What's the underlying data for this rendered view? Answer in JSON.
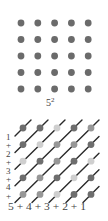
{
  "top": {
    "label_base": "5",
    "label_exp": "2",
    "grid": {
      "rows": 5,
      "cols": 5,
      "x0": 21,
      "y0": 23,
      "dx": 16.8,
      "dy": 16.5,
      "r": 3.4,
      "color": "#6b6b6b"
    }
  },
  "bottom": {
    "grid": {
      "rows": 5,
      "cols": 5,
      "x0": 23,
      "y0": 128,
      "dx": 17,
      "dy": 16.6,
      "r": 3.4
    },
    "shades": [
      [
        "dark",
        "dark",
        "light",
        "dark",
        "medium"
      ],
      [
        "dark",
        "light",
        "medium",
        "medium",
        "dark"
      ],
      [
        "light",
        "dark",
        "medium",
        "dark",
        "light"
      ],
      [
        "dark",
        "medium",
        "dark",
        "light",
        "dark"
      ],
      [
        "medium",
        "medium",
        "light",
        "dark",
        "dark"
      ]
    ],
    "colors": {
      "dark": "#6e6e6e",
      "medium": "#979797",
      "light": "#cfcfcf",
      "line": "#2a2a2a"
    },
    "left_labels": [
      "1",
      "+",
      "2",
      "+",
      "3",
      "+",
      "4",
      "+"
    ],
    "bottom_label": "5 + 4 + 3 + 2 + 1"
  }
}
